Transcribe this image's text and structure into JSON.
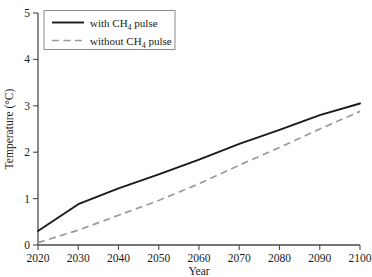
{
  "chart_data": {
    "type": "line",
    "title": "",
    "xlabel": "Year",
    "ylabel": "Temperature (°C)",
    "xlim": [
      2020,
      2100
    ],
    "ylim": [
      0,
      5
    ],
    "xticks": [
      2020,
      2030,
      2040,
      2050,
      2060,
      2070,
      2080,
      2090,
      2100
    ],
    "yticks": [
      0,
      1,
      2,
      3,
      4,
      5
    ],
    "grid": false,
    "legend_position": "upper-left",
    "x": [
      2020,
      2030,
      2040,
      2050,
      2060,
      2070,
      2080,
      2090,
      2100
    ],
    "series": [
      {
        "name": "with CH4 pulse",
        "label_main": "with CH",
        "label_sub": "4",
        "label_tail": " pulse",
        "style": "solid",
        "color": "#1a1a1a",
        "values": [
          0.3,
          0.88,
          1.22,
          1.52,
          1.84,
          2.18,
          2.48,
          2.8,
          3.05
        ]
      },
      {
        "name": "without CH4 pulse",
        "label_main": "without CH",
        "label_sub": "4",
        "label_tail": " pulse",
        "style": "dashed",
        "color": "#9a9a9a",
        "values": [
          0.05,
          0.32,
          0.64,
          0.96,
          1.32,
          1.72,
          2.1,
          2.5,
          2.88
        ]
      }
    ]
  },
  "axis": {
    "y_title_main": "Temperature (",
    "y_title_deg": "°",
    "y_title_tail": "C)",
    "x_title": "Year"
  },
  "colors": {
    "axis": "#4a4a4a",
    "solid_series": "#1a1a1a",
    "dashed_series": "#9a9a9a",
    "legend_border": "#8a8a8a",
    "background": "#ffffff"
  }
}
